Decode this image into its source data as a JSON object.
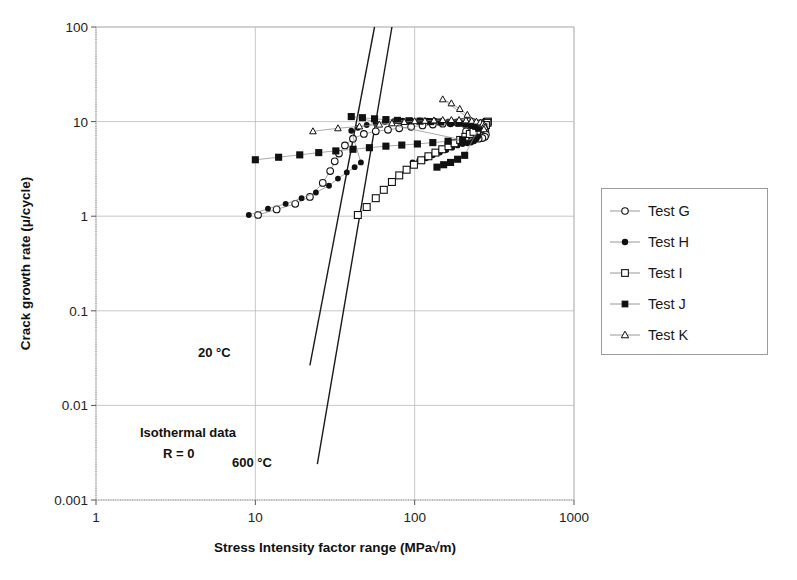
{
  "chart_data": {
    "type": "scatter",
    "title": "",
    "xlabel": "Stress Intensity factor range (MPa√m)",
    "ylabel": "Crack growth rate (μ/cycle)",
    "xscale": "log",
    "yscale": "log",
    "xlim": [
      1,
      1000
    ],
    "ylim": [
      0.001,
      100
    ],
    "xticks": [
      "1",
      "10",
      "100",
      "1000"
    ],
    "yticks": [
      "100",
      "10",
      "1",
      "0.1",
      "0.01",
      "0.001"
    ],
    "grid": true,
    "legend_position": "right-outside",
    "marker_color": "#111111",
    "line_color": "#8c8c8c",
    "reference_line_color": "#1a1a1a",
    "grid_color": "#b9b9b9",
    "axis_color": "#8f8f8f",
    "series": [
      {
        "name": "Test G",
        "marker": "open-circle",
        "points": [
          [
            10.4,
            1.03
          ],
          [
            13.6,
            1.18
          ],
          [
            17.8,
            1.35
          ],
          [
            22.0,
            1.6
          ],
          [
            26.5,
            2.25
          ],
          [
            29.5,
            3.0
          ],
          [
            31.5,
            3.8
          ],
          [
            33.5,
            4.6
          ],
          [
            36.5,
            5.6
          ],
          [
            41.0,
            6.6
          ],
          [
            48.0,
            7.4
          ],
          [
            57.0,
            7.9
          ],
          [
            68.0,
            8.2
          ],
          [
            80.0,
            8.5
          ],
          [
            95.0,
            8.8
          ],
          [
            112.0,
            9.1
          ],
          [
            130.0,
            9.3
          ],
          [
            150.0,
            9.5
          ],
          [
            168.0,
            9.6
          ],
          [
            185.0,
            9.8
          ],
          [
            200.0,
            9.9
          ],
          [
            215.0,
            10.0
          ],
          [
            232.0,
            9.9
          ],
          [
            248.0,
            9.6
          ],
          [
            262.0,
            9.1
          ],
          [
            272.0,
            8.5
          ],
          [
            278.0,
            7.9
          ],
          [
            280.0,
            7.3
          ],
          [
            276.0,
            6.9
          ],
          [
            266.0,
            6.7
          ],
          [
            252.0,
            6.6
          ],
          [
            238.0,
            6.8
          ],
          [
            226.0,
            7.1
          ],
          [
            216.0,
            7.5
          ],
          [
            210.0,
            7.9
          ]
        ]
      },
      {
        "name": "Test H",
        "marker": "filled-circle",
        "points": [
          [
            9.1,
            1.03
          ],
          [
            12.0,
            1.2
          ],
          [
            15.5,
            1.35
          ],
          [
            19.5,
            1.55
          ],
          [
            24.0,
            1.78
          ],
          [
            29.0,
            2.1
          ],
          [
            33.0,
            2.5
          ],
          [
            37.5,
            2.9
          ],
          [
            42.0,
            3.3
          ],
          [
            46.0,
            3.7
          ],
          [
            40.0,
            8.0
          ],
          [
            44.0,
            8.6
          ],
          [
            50.0,
            9.2
          ],
          [
            57.0,
            9.6
          ],
          [
            65.0,
            9.9
          ],
          [
            74.0,
            10.1
          ],
          [
            84.0,
            10.2
          ],
          [
            95.0,
            10.3
          ],
          [
            107.0,
            10.3
          ],
          [
            120.0,
            10.2
          ],
          [
            134.0,
            10.2
          ],
          [
            148.0,
            10.1
          ],
          [
            162.0,
            10.0
          ],
          [
            176.0,
            9.9
          ],
          [
            190.0,
            9.8
          ],
          [
            203.0,
            9.6
          ],
          [
            215.0,
            9.4
          ],
          [
            226.0,
            9.1
          ],
          [
            236.0,
            8.7
          ],
          [
            244.0,
            8.3
          ],
          [
            250.0,
            7.8
          ],
          [
            252.0,
            7.3
          ],
          [
            250.0,
            6.9
          ],
          [
            244.0,
            6.5
          ],
          [
            236.0,
            6.2
          ],
          [
            226.0,
            6.0
          ],
          [
            214.0,
            5.9
          ],
          [
            200.0,
            5.8
          ],
          [
            186.0,
            5.6
          ],
          [
            172.0,
            5.3
          ],
          [
            158.0,
            5.0
          ],
          [
            144.0,
            4.7
          ],
          [
            130.0,
            4.4
          ],
          [
            118.0,
            4.1
          ],
          [
            107.0,
            3.9
          ],
          [
            97.0,
            3.7
          ]
        ]
      },
      {
        "name": "Test I",
        "marker": "open-square",
        "points": [
          [
            44.0,
            1.03
          ],
          [
            50.0,
            1.25
          ],
          [
            57.0,
            1.55
          ],
          [
            64.0,
            1.9
          ],
          [
            72.0,
            2.3
          ],
          [
            80.0,
            2.7
          ],
          [
            89.0,
            3.1
          ],
          [
            99.0,
            3.5
          ],
          [
            110.0,
            3.9
          ],
          [
            122.0,
            4.3
          ],
          [
            135.0,
            4.7
          ],
          [
            149.0,
            5.1
          ],
          [
            163.0,
            5.5
          ],
          [
            178.0,
            5.9
          ],
          [
            193.0,
            6.4
          ],
          [
            208.0,
            6.9
          ],
          [
            222.0,
            7.4
          ],
          [
            236.0,
            7.9
          ],
          [
            248.0,
            8.4
          ],
          [
            260.0,
            8.9
          ],
          [
            270.0,
            9.3
          ],
          [
            278.0,
            9.7
          ],
          [
            284.0,
            9.9
          ],
          [
            288.0,
            10.0
          ],
          [
            286.0,
            9.7
          ],
          [
            280.0,
            9.2
          ],
          [
            270.0,
            8.7
          ],
          [
            258.0,
            8.3
          ],
          [
            246.0,
            8.0
          ],
          [
            234.0,
            7.8
          ]
        ]
      },
      {
        "name": "Test J",
        "marker": "filled-square",
        "points": [
          [
            10.0,
            3.95
          ],
          [
            14.0,
            4.2
          ],
          [
            19.0,
            4.45
          ],
          [
            25.0,
            4.7
          ],
          [
            32.0,
            4.9
          ],
          [
            41.0,
            5.1
          ],
          [
            52.0,
            5.3
          ],
          [
            66.0,
            5.5
          ],
          [
            83.0,
            5.65
          ],
          [
            104.0,
            5.8
          ],
          [
            130.0,
            6.0
          ],
          [
            162.0,
            6.2
          ],
          [
            200.0,
            6.4
          ],
          [
            40.0,
            11.3
          ],
          [
            47.0,
            11.0
          ],
          [
            56.0,
            10.7
          ],
          [
            66.0,
            10.5
          ],
          [
            78.0,
            10.3
          ],
          [
            92.0,
            10.2
          ],
          [
            108.0,
            10.1
          ],
          [
            126.0,
            10.0
          ],
          [
            146.0,
            9.9
          ],
          [
            168.0,
            9.8
          ],
          [
            190.0,
            9.6
          ],
          [
            210.0,
            9.4
          ],
          [
            228.0,
            9.2
          ],
          [
            242.0,
            8.9
          ],
          [
            252.0,
            8.5
          ],
          [
            206.0,
            4.4
          ],
          [
            186.0,
            4.0
          ],
          [
            168.0,
            3.7
          ],
          [
            152.0,
            3.5
          ],
          [
            138.0,
            3.3
          ]
        ]
      },
      {
        "name": "Test K",
        "marker": "open-triangle",
        "points": [
          [
            23.0,
            7.9
          ],
          [
            33.0,
            8.5
          ],
          [
            45.0,
            8.9
          ],
          [
            60.0,
            9.3
          ],
          [
            72.0,
            9.6
          ],
          [
            86.0,
            9.9
          ],
          [
            100.0,
            10.1
          ],
          [
            116.0,
            10.2
          ],
          [
            132.0,
            10.3
          ],
          [
            150.0,
            10.4
          ],
          [
            170.0,
            10.4
          ],
          [
            190.0,
            10.4
          ],
          [
            210.0,
            10.3
          ],
          [
            228.0,
            10.2
          ],
          [
            244.0,
            10.0
          ],
          [
            258.0,
            9.8
          ],
          [
            268.0,
            9.5
          ],
          [
            274.0,
            9.1
          ],
          [
            276.0,
            8.7
          ],
          [
            272.0,
            8.3
          ],
          [
            150.0,
            17.2
          ],
          [
            170.0,
            15.6
          ],
          [
            192.0,
            13.6
          ],
          [
            214.0,
            11.8
          ]
        ]
      }
    ],
    "reference_lines": [
      {
        "label": "20 °C",
        "points": [
          [
            22.0,
            0.0265
          ],
          [
            56.0,
            100.0
          ]
        ]
      },
      {
        "label": "600 °C",
        "points": [
          [
            24.5,
            0.0024
          ],
          [
            72.0,
            100.0
          ]
        ]
      }
    ],
    "annotations": [
      {
        "text": "Isothermal data"
      },
      {
        "text": "R = 0"
      }
    ]
  },
  "legend": {
    "items": [
      {
        "label": "Test G",
        "marker": "open-circle"
      },
      {
        "label": "Test H",
        "marker": "filled-circle"
      },
      {
        "label": "Test I",
        "marker": "open-square"
      },
      {
        "label": "Test J",
        "marker": "filled-square"
      },
      {
        "label": "Test K",
        "marker": "open-triangle"
      }
    ]
  }
}
